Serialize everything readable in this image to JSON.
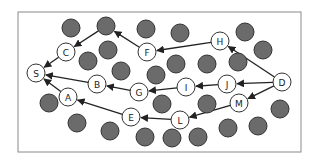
{
  "diagram": {
    "frame": {
      "x": 18,
      "y": 12,
      "w": 283,
      "h": 140
    },
    "colors": {
      "frame": "#8a8a8a",
      "gray_node_fill": "#6b6b6b",
      "gray_node_stroke": "#333333",
      "label_node_fill": "#ffffff",
      "label_node_stroke": "#333333",
      "edge": "#222222"
    },
    "labeled_nodes": [
      {
        "id": "S",
        "label": "S",
        "x": 36,
        "y": 73
      },
      {
        "id": "C",
        "label": "C",
        "x": 66,
        "y": 52
      },
      {
        "id": "A",
        "label": "A",
        "x": 68,
        "y": 97
      },
      {
        "id": "B",
        "label": "B",
        "x": 97,
        "y": 84
      },
      {
        "id": "F",
        "label": "F",
        "x": 147,
        "y": 52
      },
      {
        "id": "G",
        "label": "G",
        "x": 139,
        "y": 92
      },
      {
        "id": "E",
        "label": "E",
        "x": 131,
        "y": 117
      },
      {
        "id": "H",
        "label": "H",
        "x": 220,
        "y": 41
      },
      {
        "id": "I",
        "label": "I",
        "x": 186,
        "y": 87
      },
      {
        "id": "J",
        "label": "J",
        "x": 227,
        "y": 84
      },
      {
        "id": "D",
        "label": "D",
        "x": 282,
        "y": 82
      },
      {
        "id": "M",
        "label": "M",
        "x": 239,
        "y": 103
      },
      {
        "id": "L",
        "label": "L",
        "x": 180,
        "y": 120
      }
    ],
    "gray_nodes": [
      {
        "x": 71,
        "y": 28
      },
      {
        "x": 106,
        "y": 26
      },
      {
        "x": 146,
        "y": 29
      },
      {
        "x": 180,
        "y": 33
      },
      {
        "x": 245,
        "y": 32
      },
      {
        "x": 263,
        "y": 50
      },
      {
        "x": 108,
        "y": 50
      },
      {
        "x": 88,
        "y": 61
      },
      {
        "x": 121,
        "y": 71
      },
      {
        "x": 156,
        "y": 75
      },
      {
        "x": 176,
        "y": 64
      },
      {
        "x": 207,
        "y": 64
      },
      {
        "x": 238,
        "y": 62
      },
      {
        "x": 49,
        "y": 103
      },
      {
        "x": 77,
        "y": 123
      },
      {
        "x": 110,
        "y": 131
      },
      {
        "x": 145,
        "y": 137
      },
      {
        "x": 162,
        "y": 104
      },
      {
        "x": 207,
        "y": 104
      },
      {
        "x": 172,
        "y": 138
      },
      {
        "x": 198,
        "y": 137
      },
      {
        "x": 228,
        "y": 128
      },
      {
        "x": 258,
        "y": 126
      },
      {
        "x": 280,
        "y": 109
      }
    ],
    "edges": [
      {
        "from": "D",
        "to": "H"
      },
      {
        "from": "D",
        "to": "J"
      },
      {
        "from": "D",
        "to": "M"
      },
      {
        "from": "H",
        "to": "F"
      },
      {
        "from": "F",
        "to": "gray_top",
        "to_xy": [
          106,
          26
        ]
      },
      {
        "from": "J",
        "to": "I"
      },
      {
        "from": "I",
        "to": "G"
      },
      {
        "from": "G",
        "to": "B"
      },
      {
        "from": "B",
        "to": "S"
      },
      {
        "from": "M",
        "to": "L"
      },
      {
        "from": "L",
        "to": "E"
      },
      {
        "from": "E",
        "to": "A"
      },
      {
        "from": "A",
        "to": "S"
      },
      {
        "from": "gray_c",
        "from_xy": [
          106,
          26
        ],
        "to": "C"
      },
      {
        "from": "C",
        "to": "S"
      }
    ]
  }
}
